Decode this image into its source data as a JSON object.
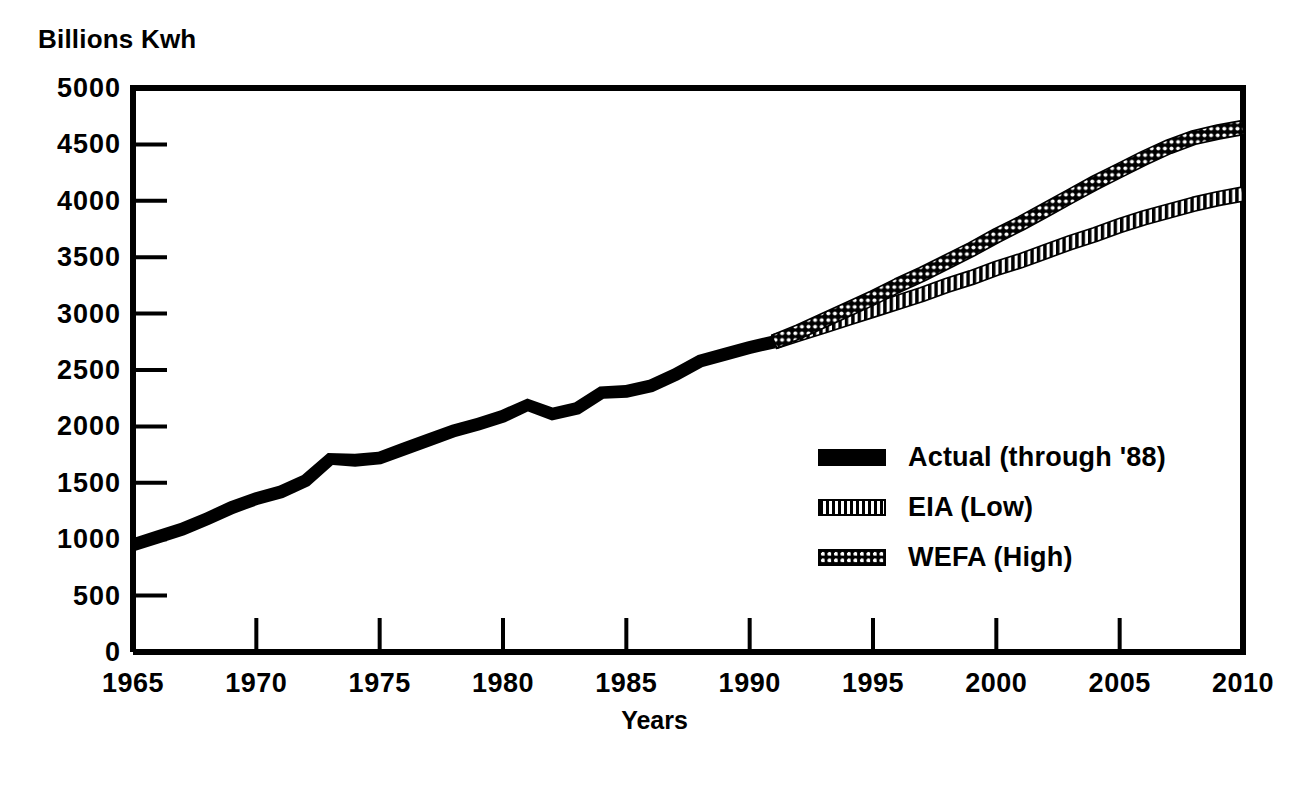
{
  "chart_data": {
    "type": "line",
    "title": "",
    "ylabel": "Billions Kwh",
    "xlabel": "Years",
    "xlim": [
      1965,
      2010
    ],
    "ylim": [
      0,
      5000
    ],
    "grid": false,
    "legend_position": "inside-right-middle",
    "ytick_labels": [
      "5000",
      "4500",
      "4000",
      "3500",
      "3000",
      "2500",
      "2000",
      "1500",
      "1000",
      "500",
      "0"
    ],
    "ytick_values": [
      5000,
      4500,
      4000,
      3500,
      3000,
      2500,
      2000,
      1500,
      1000,
      500,
      0
    ],
    "xtick_labels": [
      "1965",
      "1970",
      "1975",
      "1980",
      "1985",
      "1990",
      "1995",
      "2000",
      "2005",
      "2010"
    ],
    "xtick_values": [
      1965,
      1970,
      1975,
      1980,
      1985,
      1990,
      1995,
      2000,
      2005,
      2010
    ],
    "series": [
      {
        "name": "Actual (through '88)",
        "style": "solid-thick-black",
        "x": [
          1965,
          1966,
          1967,
          1968,
          1969,
          1970,
          1971,
          1972,
          1973,
          1974,
          1975,
          1976,
          1977,
          1978,
          1979,
          1980,
          1981,
          1982,
          1983,
          1984,
          1985,
          1986,
          1987,
          1988,
          1989,
          1990,
          1991
        ],
        "values": [
          950,
          1020,
          1090,
          1180,
          1280,
          1360,
          1420,
          1520,
          1710,
          1700,
          1720,
          1800,
          1880,
          1960,
          2020,
          2090,
          2190,
          2110,
          2160,
          2300,
          2310,
          2360,
          2460,
          2580,
          2640,
          2700,
          2750
        ]
      },
      {
        "name": "EIA (Low)",
        "style": "vertical-hatch",
        "x": [
          1991,
          1992,
          1993,
          1994,
          1995,
          1996,
          1997,
          1998,
          1999,
          2000,
          2001,
          2002,
          2003,
          2004,
          2005,
          2006,
          2007,
          2008,
          2009,
          2010
        ],
        "values": [
          2750,
          2820,
          2890,
          2960,
          3030,
          3100,
          3170,
          3250,
          3320,
          3400,
          3470,
          3550,
          3630,
          3700,
          3780,
          3850,
          3910,
          3970,
          4020,
          4060
        ]
      },
      {
        "name": "WEFA (High)",
        "style": "dotted-circles",
        "x": [
          1991,
          1992,
          1993,
          1994,
          1995,
          1996,
          1997,
          1998,
          1999,
          2000,
          2001,
          2002,
          2003,
          2004,
          2005,
          2006,
          2007,
          2008,
          2009,
          2010
        ],
        "values": [
          2750,
          2840,
          2940,
          3040,
          3140,
          3250,
          3350,
          3460,
          3570,
          3690,
          3800,
          3920,
          4040,
          4160,
          4270,
          4380,
          4480,
          4560,
          4610,
          4650
        ]
      }
    ]
  },
  "legend": {
    "items": [
      {
        "label": "Actual (through '88)",
        "swatch": "solid"
      },
      {
        "label": "EIA (Low)",
        "swatch": "hatch"
      },
      {
        "label": "WEFA (High)",
        "swatch": "dots"
      }
    ]
  },
  "axes": {
    "y_title": "Billions Kwh",
    "x_title": "Years"
  }
}
